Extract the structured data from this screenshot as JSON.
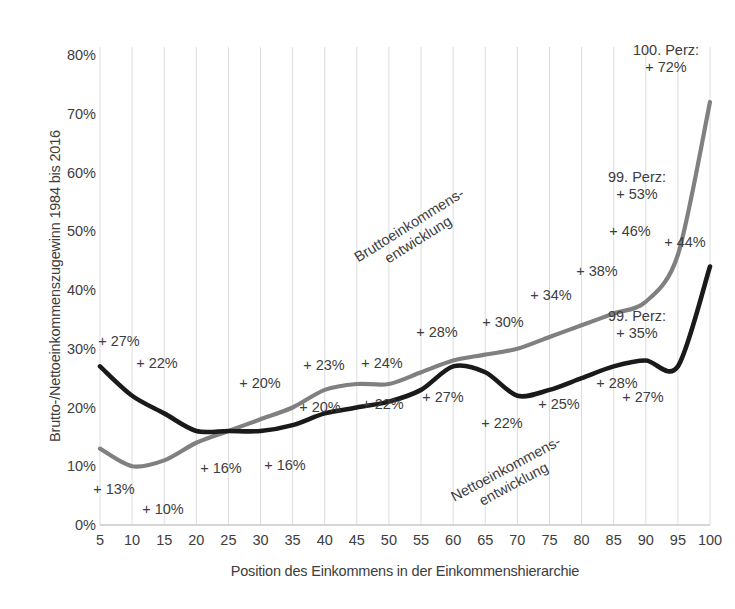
{
  "chart_data": {
    "type": "line",
    "title": "",
    "xlabel": "Position des Einkommens in der Einkommenshierarchie",
    "ylabel": "Brutto-/Nettoeinkommenszugewinn 1984 bis 2016",
    "x": [
      5,
      10,
      15,
      20,
      25,
      30,
      35,
      40,
      45,
      50,
      55,
      60,
      65,
      70,
      75,
      80,
      85,
      90,
      95,
      100
    ],
    "xlim": [
      5,
      100
    ],
    "ylim": [
      0,
      80
    ],
    "ytick_labels": [
      "0%",
      "10%",
      "20%",
      "30%",
      "40%",
      "50%",
      "60%",
      "70%",
      "80%"
    ],
    "ytick_values": [
      0,
      10,
      20,
      30,
      40,
      50,
      60,
      70,
      80
    ],
    "xtick_labels": [
      "5",
      "10",
      "15",
      "20",
      "25",
      "30",
      "35",
      "40",
      "45",
      "50",
      "55",
      "60",
      "65",
      "70",
      "75",
      "80",
      "85",
      "90",
      "95",
      "100"
    ],
    "grid": "vertical",
    "legend_position": "inline-annotations",
    "series": [
      {
        "name": "Bruttoeinkommensentwicklung",
        "color": "#808080",
        "values": [
          13,
          10,
          11,
          14,
          16,
          18,
          20,
          23,
          24,
          24,
          26,
          28,
          29,
          30,
          32,
          34,
          36,
          38,
          46,
          72
        ]
      },
      {
        "name": "Nettoeinkommensentwicklung",
        "color": "#1a1a1a",
        "values": [
          27,
          22,
          19,
          16,
          16,
          16,
          17,
          19,
          20,
          21,
          23,
          27,
          26,
          22,
          23,
          25,
          27,
          28,
          27,
          44
        ]
      }
    ],
    "data_labels": [
      {
        "text": "+ 27%",
        "x": 5,
        "series": "Nettoeinkommensentwicklung",
        "px": 119,
        "py": 342
      },
      {
        "text": "+ 22%",
        "x": 10,
        "series": "Nettoeinkommensentwicklung",
        "px": 157,
        "py": 364
      },
      {
        "text": "+ 13%",
        "x": 5,
        "series": "Bruttoeinkommensentwicklung",
        "px": 114,
        "py": 490
      },
      {
        "text": "+ 10%",
        "x": 10,
        "series": "Bruttoeinkommensentwicklung",
        "px": 163,
        "py": 510
      },
      {
        "text": "+ 16%",
        "x": 20,
        "series": "Nettoeinkommensentwicklung",
        "px": 221,
        "py": 469
      },
      {
        "text": "+ 16%",
        "x": 30,
        "series": "Nettoeinkommensentwicklung",
        "px": 285,
        "py": 466
      },
      {
        "text": "+ 20%",
        "x": 30,
        "series": "Bruttoeinkommensentwicklung",
        "px": 260,
        "py": 384
      },
      {
        "text": "+ 23%",
        "x": 40,
        "series": "Bruttoeinkommensentwicklung",
        "px": 324,
        "py": 366
      },
      {
        "text": "+ 20%",
        "x": 40,
        "series": "Nettoeinkommensentwicklung",
        "px": 320,
        "py": 408
      },
      {
        "text": "+ 24%",
        "x": 45,
        "series": "Bruttoeinkommensentwicklung",
        "px": 382,
        "py": 364
      },
      {
        "text": "+ 22%",
        "x": 50,
        "series": "Nettoeinkommensentwicklung",
        "px": 383,
        "py": 405
      },
      {
        "text": "+ 28%",
        "x": 58,
        "series": "Bruttoeinkommensentwicklung",
        "px": 437,
        "py": 333
      },
      {
        "text": "+ 27%",
        "x": 60,
        "series": "Nettoeinkommensentwicklung",
        "px": 443,
        "py": 398
      },
      {
        "text": "+ 30%",
        "x": 65,
        "series": "Bruttoeinkommensentwicklung",
        "px": 503,
        "py": 323
      },
      {
        "text": "+ 22%",
        "x": 70,
        "series": "Nettoeinkommensentwicklung",
        "px": 502,
        "py": 424
      },
      {
        "text": "+ 34%",
        "x": 78,
        "series": "Bruttoeinkommensentwicklung",
        "px": 551,
        "py": 296
      },
      {
        "text": "+ 25%",
        "x": 80,
        "series": "Nettoeinkommensentwicklung",
        "px": 559,
        "py": 405
      },
      {
        "text": "+ 38%",
        "x": 85,
        "series": "Bruttoeinkommensentwicklung",
        "px": 597,
        "py": 272
      },
      {
        "text": "+ 28%",
        "x": 88,
        "series": "Nettoeinkommensentwicklung",
        "px": 617,
        "py": 384
      },
      {
        "text": "+ 27%",
        "x": 90,
        "series": "Nettoeinkommensentwicklung",
        "px": 643,
        "py": 398
      },
      {
        "text": "+ 46%",
        "x": 95,
        "series": "Bruttoeinkommensentwicklung",
        "px": 630,
        "py": 232
      },
      {
        "text": "+ 44%",
        "x": 100,
        "series": "Nettoeinkommensentwicklung",
        "px": 685,
        "py": 243
      },
      {
        "text": "99. Perz:\n+ 53%",
        "x": 99,
        "series": "Bruttoeinkommensentwicklung",
        "px": 637,
        "py": 186
      },
      {
        "text": "99. Perz:\n+ 35%",
        "x": 99,
        "series": "Nettoeinkommensentwicklung",
        "px": 637,
        "py": 325
      },
      {
        "text": "100. Perz:\n+ 72%",
        "x": 100,
        "series": "Bruttoeinkommensentwicklung",
        "px": 666,
        "py": 59
      }
    ],
    "annotations": [
      {
        "name": "brutto-series-label",
        "text": "Bruttoeinkommens-\nentwicklung",
        "rotation": -32
      },
      {
        "name": "netto-series-label",
        "text": "Nettoeinkommens-\nentwicklung",
        "rotation": -28
      }
    ]
  },
  "colors": {
    "brutto_line": "#808080",
    "netto_line": "#1a1a1a",
    "gridline": "#dcdcdc",
    "axis": "#c8c8c8",
    "text": "#3d3d3d",
    "background": "#ffffff"
  }
}
